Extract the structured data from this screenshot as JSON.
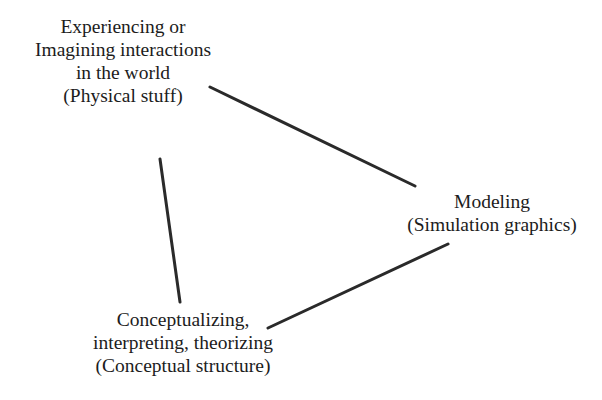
{
  "diagram": {
    "nodes": [
      {
        "id": "physical",
        "lines": [
          "Experiencing or",
          "Imagining interactions",
          "in the world",
          "(Physical stuff)"
        ]
      },
      {
        "id": "modeling",
        "lines": [
          "Modeling",
          "(Simulation graphics)"
        ]
      },
      {
        "id": "conceptual",
        "lines": [
          "Conceptualizing,",
          "interpreting, theorizing",
          "(Conceptual structure)"
        ]
      }
    ],
    "edges": [
      {
        "from": "physical",
        "to": "modeling"
      },
      {
        "from": "physical",
        "to": "conceptual"
      },
      {
        "from": "conceptual",
        "to": "modeling"
      }
    ],
    "colors": {
      "line": "#2a2a2a",
      "text": "#1c1c1c",
      "background": "#ffffff"
    }
  }
}
